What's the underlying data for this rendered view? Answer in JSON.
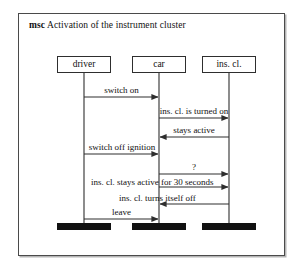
{
  "diagram": {
    "kind": "msc-sequence-diagram",
    "keyword": "msc",
    "title": "Activation of the instrument cluster",
    "lifelines": [
      {
        "id": "driver",
        "label": "driver"
      },
      {
        "id": "car",
        "label": "car"
      },
      {
        "id": "ins_cl",
        "label": "ins. cl."
      }
    ],
    "messages": [
      {
        "id": "m1",
        "label": "switch on",
        "from": "driver",
        "to": "car",
        "direction": "right"
      },
      {
        "id": "m2",
        "label": "ins. cl. is turned on",
        "from": "car",
        "to": "ins_cl",
        "direction": "right"
      },
      {
        "id": "m3",
        "label": "stays active",
        "from": "ins_cl",
        "to": "car",
        "direction": "left"
      },
      {
        "id": "m4",
        "label": "switch off ignition",
        "from": "driver",
        "to": "car",
        "direction": "right"
      },
      {
        "id": "m5",
        "label": "?",
        "from": "car",
        "to": "ins_cl",
        "direction": "right"
      },
      {
        "id": "m6",
        "label": "ins. cl. stays active for 30 seconds",
        "from": "car",
        "to": "ins_cl",
        "direction": "right"
      },
      {
        "id": "m7",
        "label": "ins. cl. turns itself off",
        "from": "ins_cl",
        "to": "car",
        "direction": "left"
      },
      {
        "id": "m8",
        "label": "leave",
        "from": "driver",
        "to": "car",
        "direction": "right"
      }
    ],
    "terminations": [
      {
        "id": "t_driver",
        "lifeline": "driver"
      },
      {
        "id": "t_car",
        "lifeline": "car"
      },
      {
        "id": "t_ins_cl",
        "lifeline": "ins_cl"
      }
    ],
    "colors": {
      "frame_border": "#4a4a4a",
      "line": "#2e2e2e",
      "text": "#111111",
      "termination_bar": "#111111",
      "background": "#ffffff"
    }
  }
}
